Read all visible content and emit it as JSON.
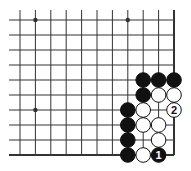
{
  "diagram": {
    "type": "go-board-fragment",
    "corner": "bottom-right",
    "grid": {
      "columns": 11,
      "rows": 10,
      "x0": 20,
      "dx": 15.4,
      "y0": 20,
      "dy": 15,
      "edge_right": true,
      "edge_bottom": true
    },
    "star_points": [
      {
        "col": 1,
        "row": 0
      },
      {
        "col": 7,
        "row": 0
      },
      {
        "col": 1,
        "row": 6
      }
    ],
    "stones": [
      {
        "col": 8,
        "row": 4,
        "color": "black"
      },
      {
        "col": 9,
        "row": 4,
        "color": "black"
      },
      {
        "col": 10,
        "row": 4,
        "color": "black"
      },
      {
        "col": 8,
        "row": 5,
        "color": "black"
      },
      {
        "col": 9,
        "row": 5,
        "color": "white"
      },
      {
        "col": 10,
        "row": 5,
        "color": "white"
      },
      {
        "col": 7,
        "row": 6,
        "color": "black"
      },
      {
        "col": 8,
        "row": 6,
        "color": "white"
      },
      {
        "col": 10,
        "row": 6,
        "color": "white",
        "label": "2"
      },
      {
        "col": 7,
        "row": 7,
        "color": "black"
      },
      {
        "col": 8,
        "row": 7,
        "color": "white"
      },
      {
        "col": 9,
        "row": 7,
        "color": "white"
      },
      {
        "col": 7,
        "row": 8,
        "color": "black"
      },
      {
        "col": 9,
        "row": 8,
        "color": "white"
      },
      {
        "col": 7,
        "row": 9,
        "color": "black"
      },
      {
        "col": 8,
        "row": 9,
        "color": "white"
      },
      {
        "col": 9,
        "row": 9,
        "color": "black",
        "label": "1"
      }
    ],
    "colors": {
      "line": "#333333",
      "black_stone": "#111111",
      "white_stone": "#ffffff",
      "background": "#ffffff"
    }
  }
}
